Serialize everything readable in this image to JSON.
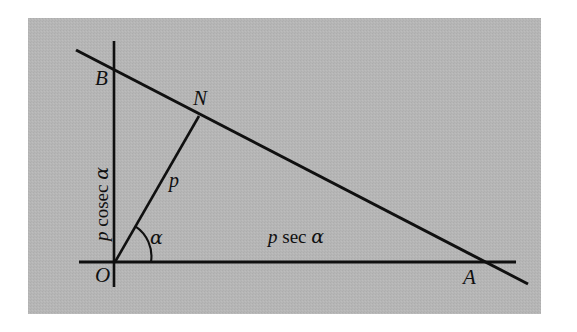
{
  "figure": {
    "kind": "geometry-diagram",
    "background_color": "#b5b5b5",
    "line_color": "#101010",
    "page_color": "#ffffff",
    "panel": {
      "x": 28,
      "y": 18,
      "width": 513,
      "height": 296
    }
  },
  "points": [
    {
      "id": "O",
      "label": "O",
      "x": 115,
      "y": 262,
      "label_x": 96,
      "label_y": 266
    },
    {
      "id": "B",
      "label": "B",
      "x": 114,
      "y": 68,
      "label_x": 95,
      "label_y": 69
    },
    {
      "id": "N",
      "label": "N",
      "x": 199,
      "y": 116,
      "label_x": 194,
      "label_y": 89
    },
    {
      "id": "A",
      "label": "A",
      "x": 476,
      "y": 262,
      "label_x": 463,
      "label_y": 268
    }
  ],
  "segments": [
    {
      "id": "y-axis",
      "name": "vertical-axis-line",
      "x1": 114,
      "y1": 41,
      "x2": 114,
      "y2": 287
    },
    {
      "id": "x-axis",
      "name": "horizontal-axis-line",
      "x1": 79,
      "y1": 262,
      "x2": 516,
      "y2": 262
    },
    {
      "id": "line-AB",
      "name": "oblique-line-through-B-N-A",
      "x1": 76,
      "y1": 50,
      "x2": 528,
      "y2": 284
    },
    {
      "id": "perp-ON",
      "name": "perpendicular-from-origin",
      "x1": 115,
      "y1": 262,
      "x2": 199,
      "y2": 116
    }
  ],
  "angle_arc": {
    "name": "alpha-angle-arc",
    "center_x": 115,
    "center_y": 262,
    "radius": 36,
    "start_x": 151,
    "start_y": 262,
    "end_x": 135,
    "end_y": 227
  },
  "labels": {
    "perpendicular": {
      "text": "p",
      "x": 169,
      "y": 171
    },
    "angle": {
      "text": "α",
      "x": 150,
      "y": 229
    },
    "y_intercept": {
      "parts": {
        "variable": "p",
        "function": "cosec",
        "angle": "α"
      },
      "text": "p cosec α",
      "x": 92,
      "y": 240
    },
    "x_intercept": {
      "parts": {
        "variable": "p",
        "function": "sec",
        "angle": "α"
      },
      "text": "p sec α",
      "x": 268,
      "y": 228
    }
  }
}
